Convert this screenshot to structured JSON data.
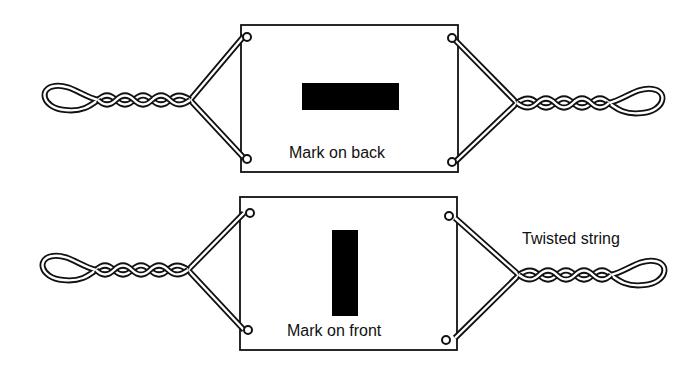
{
  "diagram": {
    "colors": {
      "ink": "#111111",
      "background": "#ffffff",
      "mark": "#000000"
    },
    "panels": [
      {
        "id": "top",
        "card_label": "Mark on back",
        "mark_orientation": "horizontal"
      },
      {
        "id": "bottom",
        "card_label": "Mark on front",
        "mark_orientation": "vertical"
      }
    ],
    "annotation": "Twisted string"
  }
}
